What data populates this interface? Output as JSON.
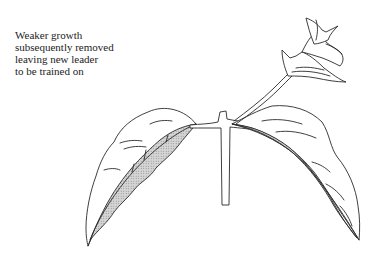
{
  "diagram": {
    "caption": {
      "lines": [
        "Weaker growth",
        "subsequently removed",
        "leaving new leader",
        "to be trained on"
      ]
    },
    "colors": {
      "line": "#2a2a2a",
      "hatch": "#bdbdbd",
      "background": "#ffffff"
    }
  }
}
